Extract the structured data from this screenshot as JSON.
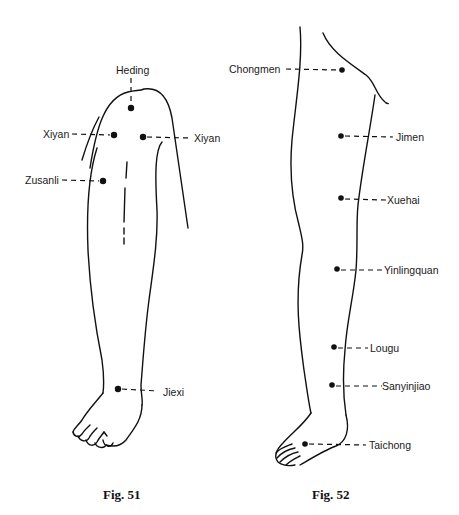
{
  "figures": [
    {
      "caption": "Fig. 51",
      "view": "anterior lower leg and foot",
      "points": [
        {
          "name": "Heding"
        },
        {
          "name": "Xiyan",
          "side": "medial"
        },
        {
          "name": "Xiyan",
          "side": "lateral"
        },
        {
          "name": "Zusanli"
        },
        {
          "name": "Jiexi"
        }
      ]
    },
    {
      "caption": "Fig. 52",
      "view": "medial leg, thigh to foot",
      "points": [
        {
          "name": "Chongmen"
        },
        {
          "name": "Jimen"
        },
        {
          "name": "Xuehai"
        },
        {
          "name": "Yinlingquan"
        },
        {
          "name": "Lougu"
        },
        {
          "name": "Sanyinjiao"
        },
        {
          "name": "Taichong"
        }
      ]
    }
  ],
  "colors": {
    "line": "#111111",
    "background": "#ffffff"
  }
}
